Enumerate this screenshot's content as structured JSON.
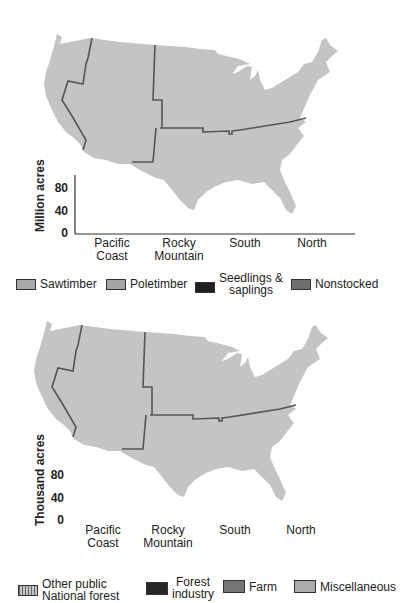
{
  "colors": {
    "map_fill": "#c4c4c4",
    "map_border": "#555555",
    "axis": "#333333",
    "sawtimber": "#a8a8a8",
    "poletimber": "#a4a4a4",
    "seedlings": "#1e1e1e",
    "nonstocked": "#6e6e6e",
    "national_forest": "#b4b4b4",
    "forest_industry": "#262626",
    "farm": "#767676",
    "miscellaneous": "#acacac"
  },
  "top": {
    "ylabel": "Million acres",
    "ticks": [
      "0",
      "40",
      "80"
    ],
    "categories": [
      "Pacific\nCoast",
      "Rocky\nMountain",
      "South",
      "North"
    ],
    "legend": [
      {
        "key": "sawtimber",
        "label": "Sawtimber"
      },
      {
        "key": "poletimber",
        "label": "Poletimber"
      },
      {
        "key": "seedlings",
        "label": "Seedlings &\nsaplings"
      },
      {
        "key": "nonstocked",
        "label": "Nonstocked"
      }
    ]
  },
  "bottom": {
    "ylabel": "Thousand acres",
    "ticks": [
      "0",
      "40",
      "80"
    ],
    "categories": [
      "Pacific\nCoast",
      "Rocky\nMountain",
      "South",
      "North"
    ],
    "legend": [
      {
        "key": "public",
        "label": "Other public\nNational forest"
      },
      {
        "key": "forest_industry",
        "label": "Forest\nindustry"
      },
      {
        "key": "farm",
        "label": "Farm"
      },
      {
        "key": "miscellaneous",
        "label": "Miscellaneous"
      }
    ]
  },
  "chart_data": [
    {
      "type": "bar",
      "title": "",
      "xlabel": "",
      "ylabel": "Million acres",
      "ylim": [
        0,
        105
      ],
      "yticks": [
        0,
        40,
        80
      ],
      "grid": false,
      "legend_position": "bottom",
      "categories": [
        "Pacific Coast",
        "Rocky Mountain",
        "South",
        "North"
      ],
      "series": [
        {
          "name": "Sawtimber",
          "values": [
            50,
            40,
            70,
            55
          ]
        },
        {
          "name": "Poletimber",
          "values": [
            10,
            20,
            73,
            66
          ]
        },
        {
          "name": "Seedlings & saplings",
          "values": [
            6,
            5,
            50,
            40
          ]
        },
        {
          "name": "Nonstocked",
          "values": [
            4,
            4,
            11,
            17
          ]
        }
      ]
    },
    {
      "type": "bar",
      "title": "",
      "xlabel": "",
      "ylabel": "Thousand acres",
      "ylim": [
        0,
        85
      ],
      "yticks": [
        0,
        40,
        80
      ],
      "grid": false,
      "legend_position": "bottom",
      "categories": [
        "Pacific Coast",
        "Rocky Mountain",
        "South",
        "North"
      ],
      "series": [
        {
          "name": "Other public / National forest",
          "values": [
            47,
            54,
            21,
            35
          ]
        },
        {
          "name": "Forest industry",
          "values": [
            14,
            5,
            40,
            15
          ]
        },
        {
          "name": "Farm",
          "values": [
            7,
            10,
            80,
            58
          ]
        },
        {
          "name": "Miscellaneous",
          "values": [
            10,
            5,
            70,
            73
          ]
        }
      ]
    }
  ]
}
